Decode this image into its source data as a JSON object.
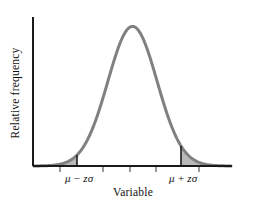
{
  "figure": {
    "kind": "normal-distribution-curve",
    "background_color": "#ffffff"
  },
  "axes": {
    "y_axis_label": "Relative frequency",
    "x_axis_label": "Variable",
    "axis_color": "#1a1a1a",
    "x_axis_y_px": 166,
    "y_axis_x_px": 33,
    "x_axis_left_px": 33,
    "x_axis_right_px": 232,
    "y_axis_top_px": 17
  },
  "curve": {
    "stroke_color": "#808080",
    "stroke_width_px": 3,
    "peak_x_px": 130,
    "peak_y_px": 19,
    "baseline_y_px": 166,
    "left_start_px": 34,
    "right_end_px": 231
  },
  "shading": {
    "fill_color": "#b9b9b9",
    "boundary_color": "#1a1a1a",
    "left_tail_boundary_x_px": 77,
    "right_tail_boundary_x_px": 181,
    "description": "Two shaded tail areas beyond the z-boundaries"
  },
  "tick_marks": {
    "color": "#555555",
    "length_px": 5,
    "positions_x_px": [
      60,
      103,
      130,
      156,
      199
    ]
  },
  "labels": {
    "left_boundary": {
      "mu": "μ",
      "operator": "−",
      "z": "z",
      "sigma": "σ",
      "full": "μ − zσ",
      "x_px": 79,
      "y_px": 181
    },
    "right_boundary": {
      "mu": "μ",
      "operator": "+",
      "z": "z",
      "sigma": "σ",
      "full": "μ + zσ",
      "x_px": 183,
      "y_px": 181
    }
  },
  "chart_data": {
    "type": "line",
    "title": "",
    "subtitle": "",
    "xlabel": "Variable",
    "ylabel": "Relative frequency",
    "grid": false,
    "legend": "none",
    "distribution": "normal",
    "mean_label": "μ",
    "sd_label": "σ",
    "annotations": [
      "μ − zσ",
      "μ + zσ"
    ],
    "shaded_regions": [
      {
        "name": "left-tail",
        "from": "-infinity",
        "to": "μ − zσ",
        "fill": "#b9b9b9"
      },
      {
        "name": "right-tail",
        "from": "μ + zσ",
        "to": "+infinity",
        "fill": "#b9b9b9"
      }
    ],
    "x": [
      -4.0,
      -3.7,
      -3.4,
      -3.1,
      -2.8,
      -2.5,
      -2.2,
      -1.9,
      -1.6,
      -1.3,
      -1.0,
      -0.7,
      -0.4,
      -0.1,
      0.2,
      0.5,
      0.8,
      1.1,
      1.4,
      1.7,
      2.0,
      2.3,
      2.6,
      2.9,
      3.2,
      3.5,
      3.8,
      4.0
    ],
    "y": [
      0.000134,
      0.000425,
      0.001232,
      0.003267,
      0.007915,
      0.017528,
      0.035475,
      0.065616,
      0.110921,
      0.171369,
      0.241971,
      0.312254,
      0.36827,
      0.396953,
      0.391043,
      0.352065,
      0.289692,
      0.217852,
      0.149727,
      0.094049,
      0.053991,
      0.028327,
      0.013583,
      0.005953,
      0.002384,
      0.000873,
      0.000292,
      0.000134
    ],
    "xlim": [
      -4.0,
      4.0
    ],
    "ylim": [
      0,
      0.42
    ],
    "z_boundaries": [
      -1.8,
      1.8
    ],
    "xticks": [
      -2.7,
      -1.1,
      0.0,
      1.0,
      2.8
    ],
    "xticklabels": [
      "",
      "",
      "",
      "",
      ""
    ],
    "yticks": [],
    "yticklabels": []
  }
}
